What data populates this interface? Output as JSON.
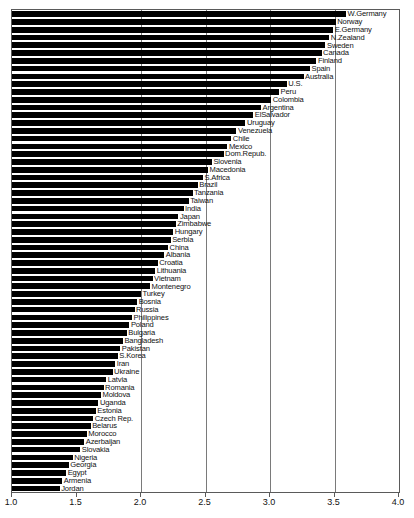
{
  "chart_data": {
    "type": "bar",
    "orientation": "horizontal",
    "title": "",
    "subtitle": "",
    "xlabel": "",
    "ylabel": "",
    "xlim": [
      1.0,
      4.0
    ],
    "grid": true,
    "gridlines": [
      2.0,
      2.5,
      3.0,
      3.5
    ],
    "legend": "none",
    "bar_color": "#000000",
    "axis_color": "#5a5a5a",
    "xticks": [
      1.0,
      1.5,
      2.0,
      2.5,
      3.0,
      3.5,
      4.0
    ],
    "xtick_labels": [
      "1.0",
      "1.5",
      "2.0",
      "2.5",
      "3.0",
      "3.5",
      "4.0"
    ],
    "categories": [
      "W.Germany",
      "Norway",
      "E.Germany",
      "N.Zealand",
      "Sweden",
      "Canada",
      "Finland",
      "Spain",
      "Australia",
      "U.S.",
      "Peru",
      "Colombia",
      "Argentina",
      "ElSalvador",
      "Uruguay",
      "Venezuela",
      "Chile",
      "Mexico",
      "Dom.Repub.",
      "Slovenia",
      "Macedonia",
      "S.Africa",
      "Brazil",
      "Tanzania",
      "Taiwan",
      "India",
      "Japan",
      "Zimbabwe",
      "Hungary",
      "Serbia",
      "China",
      "Albania",
      "Croatia",
      "Lithuania",
      "Vietnam",
      "Montenegro",
      "Turkey",
      "Bosnia",
      "Russia",
      "Philippines",
      "Poland",
      "Bulgaria",
      "Bangladesh",
      "Pakistan",
      "S.Korea",
      "Iran",
      "Ukraine",
      "Latvia",
      "Romania",
      "Moldova",
      "Uganda",
      "Estonia",
      "Czech Rep.",
      "Belarus",
      "Morocco",
      "Azerbaijan",
      "Slovakia",
      "Nigeria",
      "Georgia",
      "Egypt",
      "Armenia",
      "Jordan"
    ],
    "values": [
      3.59,
      3.51,
      3.49,
      3.46,
      3.43,
      3.4,
      3.36,
      3.31,
      3.26,
      3.13,
      3.07,
      3.01,
      2.93,
      2.87,
      2.81,
      2.74,
      2.7,
      2.67,
      2.64,
      2.55,
      2.52,
      2.48,
      2.44,
      2.4,
      2.37,
      2.33,
      2.29,
      2.27,
      2.25,
      2.23,
      2.21,
      2.18,
      2.13,
      2.11,
      2.09,
      2.07,
      2.0,
      1.97,
      1.95,
      1.93,
      1.91,
      1.89,
      1.86,
      1.84,
      1.82,
      1.8,
      1.78,
      1.73,
      1.71,
      1.69,
      1.67,
      1.65,
      1.63,
      1.61,
      1.58,
      1.56,
      1.53,
      1.47,
      1.44,
      1.42,
      1.39,
      1.37
    ]
  }
}
